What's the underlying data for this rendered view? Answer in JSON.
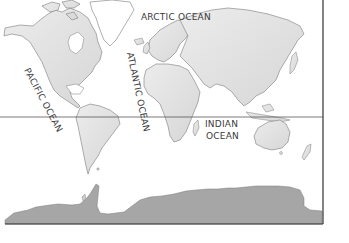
{
  "map": {
    "type": "world outline map",
    "colors": {
      "ocean": "#ffffff",
      "land": "#e4e4e4",
      "land_shade": "#d2d2d2",
      "coastline": "#7a7a7a",
      "antarctica": "#a6a6a6",
      "equator": "#555555",
      "frame": "#333333",
      "label": "#3a3a3a"
    },
    "labels": {
      "arctic": "ARCTIC OCEAN",
      "pacific": "PACIFIC OCEAN",
      "atlantic": "ATLANTIC OCEAN",
      "indian_line1": "INDIAN",
      "indian_line2": "OCEAN"
    },
    "lines": {
      "equator_y": 117
    }
  }
}
